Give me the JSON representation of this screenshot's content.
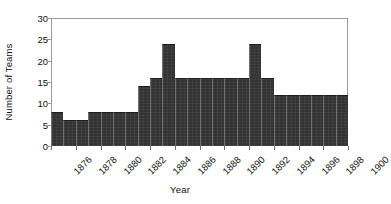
{
  "chart_data": {
    "type": "bar",
    "title": "",
    "xlabel": "Year",
    "ylabel": "Number of Teams",
    "ylim": [
      0,
      30
    ],
    "ytick_values": [
      0,
      5,
      10,
      15,
      20,
      25,
      30
    ],
    "ytick_labels": [
      "0",
      "5",
      "10",
      "15",
      "20",
      "25",
      "30"
    ],
    "grid": false,
    "legend": false,
    "bar_color": "#333333",
    "categories": [
      "1876",
      "1877",
      "1878",
      "1879",
      "1880",
      "1881",
      "1882",
      "1883",
      "1884",
      "1885",
      "1886",
      "1887",
      "1888",
      "1889",
      "1890",
      "1891",
      "1892",
      "1893",
      "1894",
      "1895",
      "1896",
      "1897",
      "1898",
      "1899"
    ],
    "values": [
      8,
      6,
      6,
      8,
      8,
      8,
      8,
      14,
      16,
      24,
      16,
      16,
      16,
      16,
      16,
      16,
      24,
      16,
      12,
      12,
      12,
      12,
      12,
      12
    ],
    "xtick_labels": [
      "1876",
      "1878",
      "1880",
      "1882",
      "1884",
      "1886",
      "1888",
      "1890",
      "1892",
      "1894",
      "1896",
      "1898",
      "1900"
    ]
  }
}
